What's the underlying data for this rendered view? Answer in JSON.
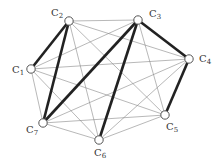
{
  "diagram": {
    "type": "complete-graph",
    "nodes": [
      {
        "id": "C1",
        "label": "C",
        "sub": "1",
        "x": 31,
        "y": 69,
        "lx": 12,
        "ly": 73
      },
      {
        "id": "C2",
        "label": "C",
        "sub": "2",
        "x": 69,
        "y": 21,
        "lx": 51,
        "ly": 16
      },
      {
        "id": "C3",
        "label": "C",
        "sub": "3",
        "x": 138,
        "y": 20,
        "lx": 149,
        "ly": 17
      },
      {
        "id": "C4",
        "label": "C",
        "sub": "4",
        "x": 189,
        "y": 59,
        "lx": 199,
        "ly": 62
      },
      {
        "id": "C5",
        "label": "C",
        "sub": "5",
        "x": 165,
        "y": 115,
        "lx": 166,
        "ly": 130
      },
      {
        "id": "C6",
        "label": "C",
        "sub": "6",
        "x": 99,
        "y": 140,
        "lx": 94,
        "ly": 156
      },
      {
        "id": "C7",
        "label": "C",
        "sub": "7",
        "x": 43,
        "y": 123,
        "lx": 26,
        "ly": 133
      }
    ],
    "thick_edges": [
      [
        "C1",
        "C2"
      ],
      [
        "C2",
        "C7"
      ],
      [
        "C7",
        "C3"
      ],
      [
        "C3",
        "C6"
      ],
      [
        "C3",
        "C4"
      ],
      [
        "C4",
        "C5"
      ]
    ],
    "colors": {
      "thin": "#888888",
      "thick": "#222222",
      "node_fill": "#ffffff",
      "node_stroke": "#555555"
    }
  }
}
